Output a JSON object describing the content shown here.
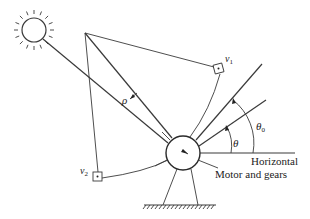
{
  "diagram": {
    "type": "physics-schematic",
    "labels": {
      "v1": "v",
      "v1_sub": "1",
      "v2": "v",
      "v2_sub": "2",
      "rho": "ρ",
      "theta": "θ",
      "theta0": "θ",
      "theta0_sub": "0",
      "horizontal": "Horizontal",
      "motor": "Motor and gears"
    },
    "components": [
      {
        "id": "sun",
        "desc": "Sun symbol with rays, upper-left"
      },
      {
        "id": "sun-ray",
        "desc": "Line from sun to pivot"
      },
      {
        "id": "apex",
        "desc": "Vertex point where lines converge at top"
      },
      {
        "id": "sensor-v1",
        "desc": "Small square sensor v1 on upper-right arc"
      },
      {
        "id": "sensor-v2",
        "desc": "Small square sensor v2 on lower-left arc"
      },
      {
        "id": "pivot",
        "desc": "Circle representing motor and gears"
      },
      {
        "id": "line-theta0",
        "desc": "Reference line at angle theta0"
      },
      {
        "id": "line-theta",
        "desc": "Panel line at angle theta"
      },
      {
        "id": "horizontal-line",
        "desc": "Horizontal reference"
      },
      {
        "id": "stand",
        "desc": "Two-leg support on hatched ground"
      }
    ],
    "colors": {
      "stroke": "#3a3a3a",
      "background": "#ffffff"
    }
  }
}
